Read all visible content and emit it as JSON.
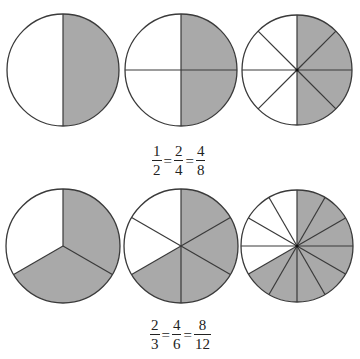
{
  "colors": {
    "shaded": "#a9a9a9",
    "unshaded": "#ffffff",
    "stroke": "#3a3a3a"
  },
  "rows": [
    {
      "circles": [
        {
          "cx": 63,
          "cy": 70,
          "r": 56,
          "parts": 2,
          "shaded_parts": 1,
          "shaded_start_deg": 0,
          "shaded_end_deg": 180
        },
        {
          "cx": 181,
          "cy": 70,
          "r": 56,
          "parts": 4,
          "shaded_parts": 2,
          "shaded_start_deg": 0,
          "shaded_end_deg": 180
        },
        {
          "cx": 297,
          "cy": 70,
          "r": 55,
          "parts": 8,
          "shaded_parts": 4,
          "shaded_start_deg": 0,
          "shaded_end_deg": 180
        }
      ],
      "equation": {
        "x": 152,
        "y": 144,
        "fractions": [
          {
            "num": "1",
            "den": "2"
          },
          {
            "num": "2",
            "den": "4"
          },
          {
            "num": "4",
            "den": "8"
          }
        ],
        "equals": "="
      }
    },
    {
      "circles": [
        {
          "cx": 63,
          "cy": 246,
          "r": 57,
          "parts": 3,
          "shaded_parts": 2,
          "shaded_start_deg": 0,
          "shaded_end_deg": 240
        },
        {
          "cx": 181,
          "cy": 246,
          "r": 57,
          "parts": 6,
          "shaded_parts": 4,
          "shaded_start_deg": 0,
          "shaded_end_deg": 240
        },
        {
          "cx": 297,
          "cy": 246,
          "r": 56,
          "parts": 12,
          "shaded_parts": 8,
          "shaded_start_deg": 0,
          "shaded_end_deg": 240
        }
      ],
      "equation": {
        "x": 150,
        "y": 318,
        "fractions": [
          {
            "num": "2",
            "den": "3"
          },
          {
            "num": "4",
            "den": "6"
          },
          {
            "num": "8",
            "den": "12"
          }
        ],
        "equals": "="
      }
    }
  ]
}
